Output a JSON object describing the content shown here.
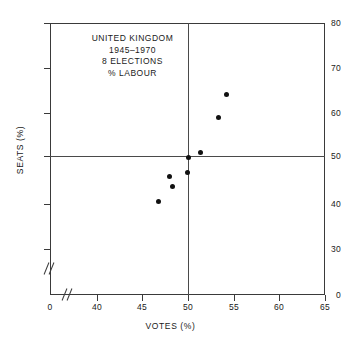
{
  "chart_data": {
    "type": "scatter",
    "title": "UNITED KINGDOM",
    "annotation_lines": [
      "UNITED KINGDOM",
      "1945–1970",
      "8 ELECTIONS",
      "% LABOUR"
    ],
    "xlabel": "VOTES (%)",
    "ylabel": "SEATS (%)",
    "xlim": [
      38.5,
      65
    ],
    "ylim": [
      28,
      80
    ],
    "x_ticks": [
      {
        "value": 0,
        "label": "0",
        "px": 50
      },
      {
        "value": 40,
        "label": "40",
        "px": 97
      },
      {
        "value": 45,
        "label": "45",
        "px": 142
      },
      {
        "value": 50,
        "label": "50",
        "px": 188
      },
      {
        "value": 55,
        "label": "55",
        "px": 234
      },
      {
        "value": 60,
        "label": "60",
        "px": 279
      },
      {
        "value": 65,
        "label": "65",
        "px": 325
      }
    ],
    "y_ticks": [
      {
        "value": 0,
        "label": "0",
        "px": 295
      },
      {
        "value": 30,
        "label": "30",
        "px": 249
      },
      {
        "value": 40,
        "label": "40",
        "px": 204
      },
      {
        "value": 50,
        "label": "50",
        "px": 156
      },
      {
        "value": 60,
        "label": "60",
        "px": 113
      },
      {
        "value": 70,
        "label": "70",
        "px": 68
      },
      {
        "value": 80,
        "label": "80",
        "px": 23
      }
    ],
    "axis_breaks": {
      "x": true,
      "y": true
    },
    "reference_lines": [
      {
        "axis": "x",
        "value": 50
      },
      {
        "axis": "y",
        "value": 50
      }
    ],
    "grid": false,
    "legend": null,
    "marker": {
      "shape": "circle",
      "color": "#111111",
      "size": 5
    },
    "points": [
      {
        "votes": 46.7,
        "seats": 40.6,
        "px": 158,
        "py": 201
      },
      {
        "votes": 47.9,
        "seats": 46.1,
        "px": 169,
        "py": 176
      },
      {
        "votes": 48.2,
        "seats": 43.9,
        "px": 172,
        "py": 186
      },
      {
        "votes": 49.9,
        "seats": 47.0,
        "px": 187,
        "py": 172
      },
      {
        "votes": 50.0,
        "seats": 50.3,
        "px": 188,
        "py": 157
      },
      {
        "votes": 51.3,
        "seats": 51.5,
        "px": 200,
        "py": 152
      },
      {
        "votes": 53.3,
        "seats": 59.2,
        "px": 218,
        "py": 117
      },
      {
        "votes": 54.2,
        "seats": 64.3,
        "px": 226,
        "py": 94
      }
    ]
  }
}
